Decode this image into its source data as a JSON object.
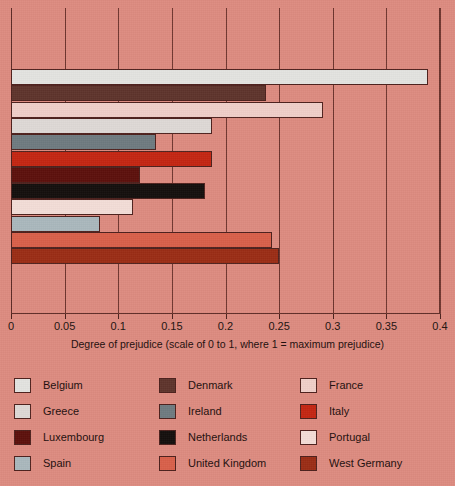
{
  "chart_data": {
    "type": "bar",
    "orientation": "horizontal",
    "title": "",
    "xlabel": "Degree of prejudice (scale of 0 to 1, where 1 = maximum prejudice)",
    "ylabel": "",
    "xlim": [
      0,
      0.4
    ],
    "xticks": [
      0,
      0.05,
      0.1,
      0.15,
      0.2,
      0.25,
      0.3,
      0.35,
      0.4
    ],
    "xtick_labels": [
      "0",
      "0.05",
      "0.1",
      "0.15",
      "0.2",
      "0.25",
      "0.3",
      "0.35",
      "0.4"
    ],
    "grid": true,
    "legend_position": "bottom",
    "categories": [
      "Belgium",
      "Denmark",
      "France",
      "Greece",
      "Ireland",
      "Italy",
      "Luxembourg",
      "Netherlands",
      "Portugal",
      "Spain",
      "United Kingdom",
      "West Germany"
    ],
    "values": [
      0.389,
      0.238,
      0.291,
      0.187,
      0.135,
      0.187,
      0.12,
      0.181,
      0.114,
      0.083,
      0.243,
      0.25
    ],
    "colors": [
      "#e3e3e0",
      "#5e342c",
      "#f0cfc9",
      "#ded9d6",
      "#6f7b80",
      "#c42612",
      "#5c100c",
      "#140f0d",
      "#f3ddd7",
      "#aab8bd",
      "#d9604a",
      "#9b2d15"
    ],
    "bars": [
      {
        "label": "Belgium",
        "value": 0.389,
        "color": "#e3e3e0"
      },
      {
        "label": "Denmark",
        "value": 0.238,
        "color": "#5e342c"
      },
      {
        "label": "France",
        "value": 0.291,
        "color": "#f0cfc9"
      },
      {
        "label": "Greece",
        "value": 0.187,
        "color": "#ded9d6"
      },
      {
        "label": "Ireland",
        "value": 0.135,
        "color": "#6f7b80"
      },
      {
        "label": "Italy",
        "value": 0.187,
        "color": "#c42612"
      },
      {
        "label": "Luxembourg",
        "value": 0.12,
        "color": "#5c100c"
      },
      {
        "label": "Netherlands",
        "value": 0.181,
        "color": "#140f0d"
      },
      {
        "label": "Portugal",
        "value": 0.114,
        "color": "#f3ddd7"
      },
      {
        "label": "Spain",
        "value": 0.083,
        "color": "#aab8bd"
      },
      {
        "label": "United Kingdom",
        "value": 0.243,
        "color": "#d9604a"
      },
      {
        "label": "West Germany",
        "value": 0.25,
        "color": "#9b2d15"
      }
    ]
  },
  "legend": {
    "columns": [
      [
        {
          "label": "Belgium",
          "color": "#e3e3e0"
        },
        {
          "label": "Greece",
          "color": "#ded9d6"
        },
        {
          "label": "Luxembourg",
          "color": "#5c100c"
        },
        {
          "label": "Spain",
          "color": "#aab8bd"
        }
      ],
      [
        {
          "label": "Denmark",
          "color": "#5e342c"
        },
        {
          "label": "Ireland",
          "color": "#6f7b80"
        },
        {
          "label": "Netherlands",
          "color": "#140f0d"
        },
        {
          "label": "United Kingdom",
          "color": "#d9604a"
        }
      ],
      [
        {
          "label": "France",
          "color": "#f0cfc9"
        },
        {
          "label": "Italy",
          "color": "#c42612"
        },
        {
          "label": "Portugal",
          "color": "#f3ddd7"
        },
        {
          "label": "West Germany",
          "color": "#9b2d15"
        }
      ]
    ]
  },
  "style": {
    "background_color": "#dd8b80",
    "axis_color": "#5d2b26",
    "grid_color": "#6e352e",
    "text_color": "#1d0e0c"
  }
}
